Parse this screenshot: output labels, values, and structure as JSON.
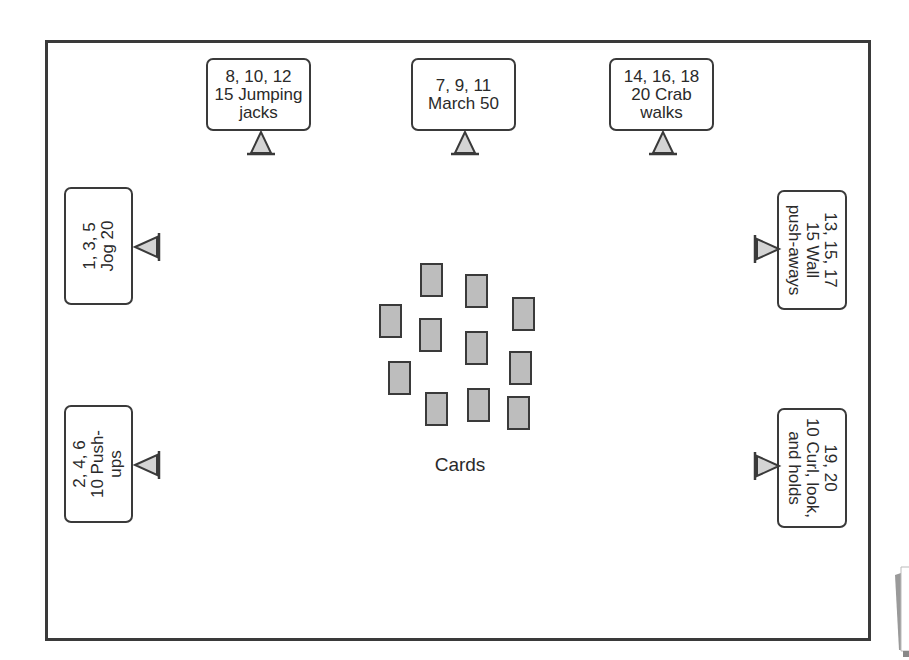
{
  "diagram": {
    "stations": [
      {
        "id": "top-left",
        "lines": [
          "8, 10, 12",
          "15 Jumping",
          "jacks"
        ],
        "orientation": "horizontal",
        "stand": "below"
      },
      {
        "id": "top-center",
        "lines": [
          "7, 9, 11",
          "March 50"
        ],
        "orientation": "horizontal",
        "stand": "below"
      },
      {
        "id": "top-right",
        "lines": [
          "14, 16, 18",
          "20 Crab",
          "walks"
        ],
        "orientation": "horizontal",
        "stand": "below"
      },
      {
        "id": "left-upper",
        "lines": [
          "1, 3, 5",
          "Jog 20"
        ],
        "orientation": "rotated-left",
        "stand": "right"
      },
      {
        "id": "left-lower",
        "lines": [
          "2, 4, 6",
          "10 Push-",
          "ups"
        ],
        "orientation": "rotated-left",
        "stand": "right"
      },
      {
        "id": "right-upper",
        "lines": [
          "13, 15, 17",
          "15 Wall",
          "push-aways"
        ],
        "orientation": "rotated-right",
        "stand": "left"
      },
      {
        "id": "right-lower",
        "lines": [
          "19, 20",
          "10 Curl, look,",
          "and holds"
        ],
        "orientation": "rotated-right",
        "stand": "left"
      }
    ],
    "cards": {
      "label": "Cards",
      "count": 11,
      "fill_color": "#bdbdbd",
      "border_color": "#3a3a3a"
    },
    "colors": {
      "border": "#3a3a3a",
      "stand_fill": "#d4d4d4",
      "background": "#ffffff"
    }
  }
}
